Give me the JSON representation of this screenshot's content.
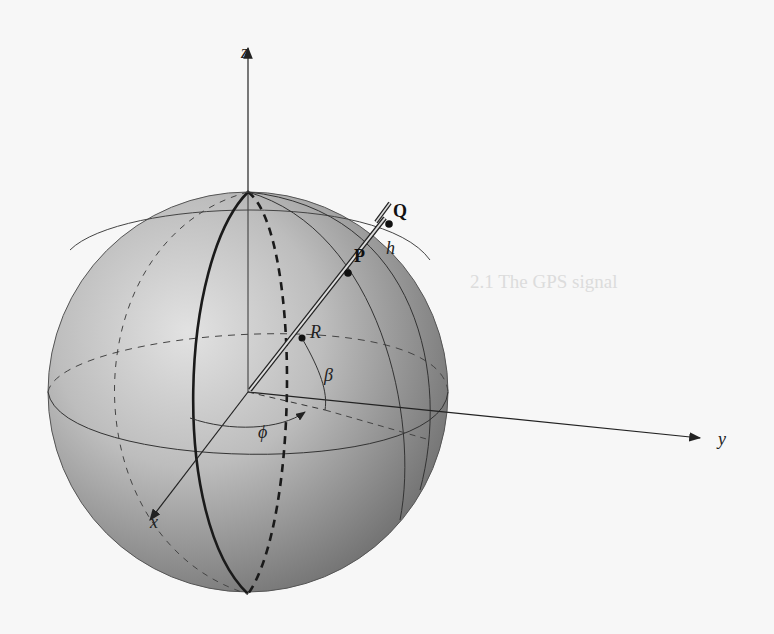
{
  "figure": {
    "axes": {
      "x": "x",
      "y": "y",
      "z": "z"
    },
    "points": {
      "Q": "Q",
      "P": "P"
    },
    "labels": {
      "R": "R",
      "h": "h",
      "beta": "β",
      "phi": "ϕ"
    }
  },
  "bleed_through": {
    "lines": [
      "",
      "",
      "",
      "",
      "",
      "",
      "",
      "",
      "",
      "",
      "2.1 The GPS signal"
    ]
  }
}
